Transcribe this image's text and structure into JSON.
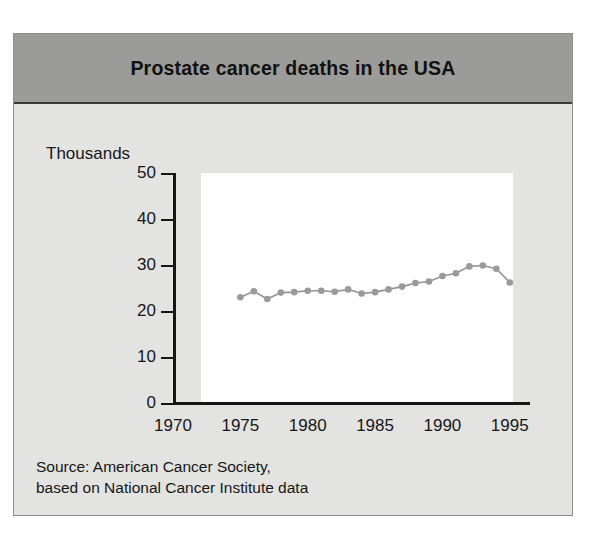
{
  "figure": {
    "title": "Prostate cancer deaths in the USA",
    "y_axis_unit_label": "Thousands",
    "source_line_1": "Source: American Cancer Society,",
    "source_line_2": "based on National Cancer Institute data",
    "colors": {
      "header_band": "#9b9b9a",
      "body_background": "#e3e3e1",
      "plot_background": "#ffffff",
      "axis": "#161616",
      "series_line": "#949494",
      "series_marker": "#9a9a9a",
      "text": "#171717"
    }
  },
  "chart_data": {
    "type": "line",
    "title": "Prostate cancer deaths in the USA",
    "xlabel": "",
    "ylabel": "Thousands",
    "xlim": [
      1970,
      1996.5
    ],
    "ylim": [
      0,
      50
    ],
    "xticks": [
      1970,
      1975,
      1980,
      1985,
      1990,
      1995
    ],
    "yticks": [
      0,
      10,
      20,
      30,
      40,
      50
    ],
    "grid": false,
    "legend": "none",
    "x": [
      1975,
      1976,
      1977,
      1978,
      1979,
      1980,
      1981,
      1982,
      1983,
      1984,
      1985,
      1986,
      1987,
      1988,
      1989,
      1990,
      1991,
      1992,
      1993,
      1994,
      1995
    ],
    "values": [
      23.0,
      24.3,
      22.6,
      24.0,
      24.1,
      24.4,
      24.4,
      24.2,
      24.7,
      23.8,
      24.1,
      24.7,
      25.3,
      26.1,
      26.4,
      27.6,
      28.2,
      29.7,
      29.9,
      29.2,
      26.2
    ],
    "series": [
      {
        "name": "Prostate cancer deaths",
        "values": [
          23.0,
          24.3,
          22.6,
          24.0,
          24.1,
          24.4,
          24.4,
          24.2,
          24.7,
          23.8,
          24.1,
          24.7,
          25.3,
          26.1,
          26.4,
          27.6,
          28.2,
          29.7,
          29.9,
          29.2,
          26.2
        ]
      }
    ]
  }
}
